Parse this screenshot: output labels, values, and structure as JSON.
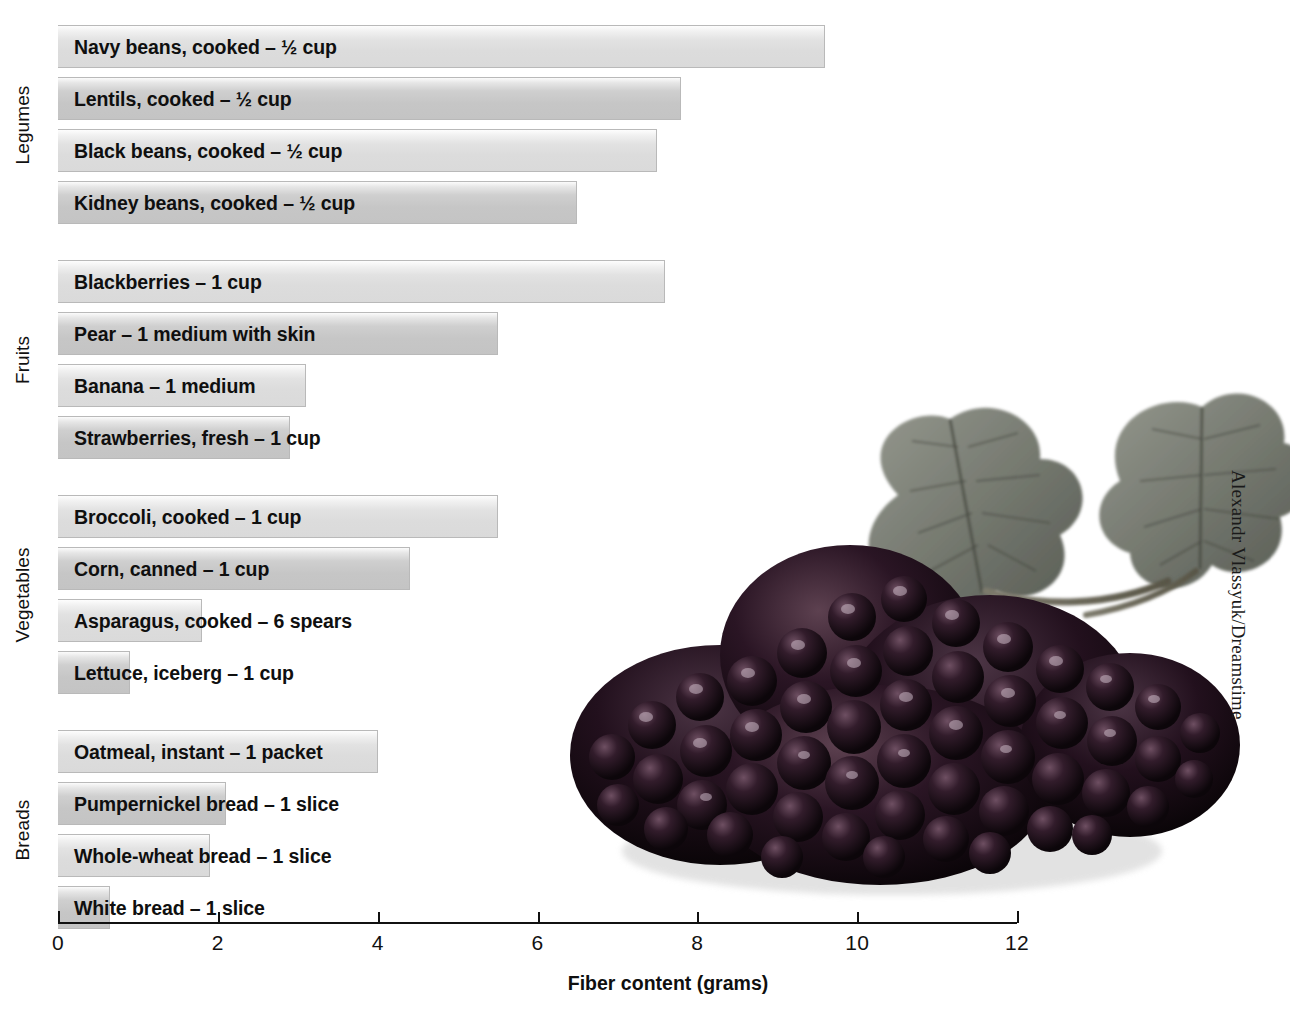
{
  "chart_data": {
    "type": "bar",
    "orientation": "horizontal",
    "title": "",
    "xlabel": "Fiber content (grams)",
    "ylabel": "",
    "xlim": [
      0,
      12
    ],
    "xticks": [
      0,
      2,
      4,
      6,
      8,
      10,
      12
    ],
    "xtick_labels": [
      "0",
      "2",
      "4",
      "6",
      "8",
      "10",
      "12"
    ],
    "grid": false,
    "legend": "none",
    "groups": [
      {
        "name": "Legumes",
        "items": [
          {
            "label": "Navy beans, cooked – ½ cup",
            "value": 9.6,
            "shade": "light"
          },
          {
            "label": "Lentils, cooked – ½ cup",
            "value": 7.8,
            "shade": "dark"
          },
          {
            "label": "Black beans, cooked – ½ cup",
            "value": 7.5,
            "shade": "light"
          },
          {
            "label": "Kidney beans, cooked – ½ cup",
            "value": 6.5,
            "shade": "dark"
          }
        ]
      },
      {
        "name": "Fruits",
        "items": [
          {
            "label": "Blackberries – 1 cup",
            "value": 7.6,
            "shade": "light"
          },
          {
            "label": "Pear – 1 medium with skin",
            "value": 5.5,
            "shade": "dark"
          },
          {
            "label": "Banana – 1 medium",
            "value": 3.1,
            "shade": "light"
          },
          {
            "label": "Strawberries, fresh – 1 cup",
            "value": 2.9,
            "shade": "dark"
          }
        ]
      },
      {
        "name": "Vegetables",
        "items": [
          {
            "label": "Broccoli, cooked – 1 cup",
            "value": 5.5,
            "shade": "light"
          },
          {
            "label": "Corn, canned – 1 cup",
            "value": 4.4,
            "shade": "dark"
          },
          {
            "label": "Asparagus, cooked – 6 spears",
            "value": 1.8,
            "shade": "light"
          },
          {
            "label": "Lettuce, iceberg – 1 cup",
            "value": 0.9,
            "shade": "dark"
          }
        ]
      },
      {
        "name": "Breads",
        "items": [
          {
            "label": "Oatmeal, instant – 1 packet",
            "value": 4.0,
            "shade": "light"
          },
          {
            "label": "Pumpernickel bread – 1 slice",
            "value": 2.1,
            "shade": "dark"
          },
          {
            "label": "Whole-wheat bread – 1 slice",
            "value": 1.9,
            "shade": "light"
          },
          {
            "label": "White bread – 1 slice",
            "value": 0.65,
            "shade": "dark"
          }
        ]
      }
    ]
  },
  "photo": {
    "credit": "Alexandr Vlassyuk/Dreamstime",
    "subject": "blackberries-photograph"
  },
  "colors": {
    "bar_light": "#dcdcdc",
    "bar_dark": "#c6c6c6",
    "axis": "#111111",
    "text": "#0f0f0f",
    "background": "#ffffff"
  }
}
